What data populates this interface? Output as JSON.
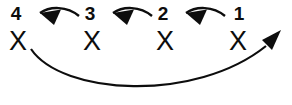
{
  "diagram": {
    "background_color": "#ffffff",
    "ink_color": "#0d0d0d",
    "nodes": [
      {
        "id": "node-4",
        "label": "4",
        "mark": "X",
        "cx": 18,
        "label_x": 16,
        "label_y": 20,
        "mark_y": 50
      },
      {
        "id": "node-3",
        "label": "3",
        "mark": "X",
        "cx": 92,
        "label_x": 90,
        "label_y": 20,
        "mark_y": 50
      },
      {
        "id": "node-2",
        "label": "2",
        "mark": "X",
        "cx": 165,
        "label_x": 163,
        "label_y": 20,
        "mark_y": 50
      },
      {
        "id": "node-1",
        "label": "1",
        "mark": "X",
        "cx": 238,
        "label_x": 239,
        "label_y": 20,
        "mark_y": 50
      }
    ],
    "arrows": [
      {
        "id": "arrow-1-to-2",
        "from": "1",
        "to": "2",
        "direction": "right-to-left",
        "path": "M 225 16 C 213 6 196 6 186 13",
        "stroke_width": 2.4,
        "head_points": "186,13 204,10 197,24",
        "head_rotate": 0
      },
      {
        "id": "arrow-2-to-3",
        "from": "2",
        "to": "3",
        "direction": "right-to-left",
        "path": "M 152 16 C 140 6 123 6 113 13",
        "stroke_width": 2.4,
        "head_points": "113,13 131,10 124,24",
        "head_rotate": 0
      },
      {
        "id": "arrow-3-to-4",
        "from": "3",
        "to": "4",
        "direction": "right-to-left",
        "path": "M 79 16 C 67 6 50 6 40 13",
        "stroke_width": 2.4,
        "head_points": "40,13 58,10 51,24",
        "head_rotate": 0
      },
      {
        "id": "arrow-4-to-1-wrap",
        "from": "4",
        "to": "1",
        "direction": "left-to-right-wrap-below",
        "path": "M 31 49 C 58 92 190 104 266 45",
        "stroke_width": 2.2,
        "head_points": "280,31 269,56 258,42",
        "head_rotate": 0
      }
    ]
  }
}
